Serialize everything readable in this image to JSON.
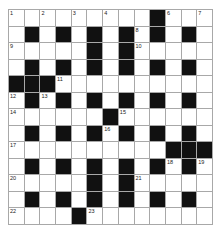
{
  "puzzle": {
    "rows": 13,
    "cols": 13,
    "colors": {
      "block": "#111111",
      "cell": "#ffffff",
      "gridline": "#a8a8a8"
    },
    "grid": [
      ".........#...",
      ".#.#.#.#.#.#.",
      ".....#.#.....",
      ".#.#.#.#.#.#.",
      "###..........",
      ".#.#.#.#.#.#.",
      "......#......",
      ".#.#.#.#.#.#.",
      "..........###",
      ".#.#.#.#.#.#.",
      ".....#.#.....",
      ".#.#.#.#.#.#.",
      "....#........"
    ],
    "numbers": [
      {
        "r": 0,
        "c": 0,
        "n": "1"
      },
      {
        "r": 0,
        "c": 2,
        "n": "2"
      },
      {
        "r": 0,
        "c": 4,
        "n": "3"
      },
      {
        "r": 0,
        "c": 6,
        "n": "4"
      },
      {
        "r": 0,
        "c": 9,
        "n": "5"
      },
      {
        "r": 0,
        "c": 10,
        "n": "6"
      },
      {
        "r": 0,
        "c": 12,
        "n": "7"
      },
      {
        "r": 1,
        "c": 8,
        "n": "8"
      },
      {
        "r": 2,
        "c": 0,
        "n": "9"
      },
      {
        "r": 2,
        "c": 8,
        "n": "10"
      },
      {
        "r": 4,
        "c": 3,
        "n": "11"
      },
      {
        "r": 5,
        "c": 0,
        "n": "12"
      },
      {
        "r": 5,
        "c": 2,
        "n": "13"
      },
      {
        "r": 6,
        "c": 0,
        "n": "14"
      },
      {
        "r": 6,
        "c": 7,
        "n": "15"
      },
      {
        "r": 7,
        "c": 6,
        "n": "16"
      },
      {
        "r": 8,
        "c": 0,
        "n": "17"
      },
      {
        "r": 9,
        "c": 10,
        "n": "18"
      },
      {
        "r": 9,
        "c": 12,
        "n": "19"
      },
      {
        "r": 10,
        "c": 0,
        "n": "20"
      },
      {
        "r": 10,
        "c": 8,
        "n": "21"
      },
      {
        "r": 12,
        "c": 0,
        "n": "22"
      },
      {
        "r": 12,
        "c": 5,
        "n": "23"
      }
    ]
  }
}
